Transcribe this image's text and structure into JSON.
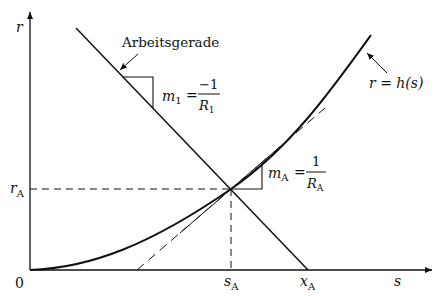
{
  "diagram": {
    "axes": {
      "y_label": "r",
      "x_label": "s",
      "origin_label": "0"
    },
    "ticks": {
      "r_A": {
        "main": "r",
        "sub": "A"
      },
      "s_A": {
        "main": "s",
        "sub": "A"
      },
      "x_A": {
        "main": "x",
        "sub": "A"
      }
    },
    "labels": {
      "working_line": "Arbeitsgerade",
      "curve": "r = h(s)",
      "curve_parts": {
        "lhs": "r",
        "eq": " = ",
        "fn": "h(s)"
      },
      "slope1": {
        "m": "m",
        "m_sub": "1",
        "eq": "=",
        "num": "−1",
        "den": "R",
        "den_sub": "1"
      },
      "slopeA": {
        "m": "m",
        "m_sub": "A",
        "eq": "=",
        "num": "1",
        "den": "R",
        "den_sub": "A"
      }
    },
    "colors": {
      "ink": "#111111",
      "background": "#ffffff"
    }
  }
}
